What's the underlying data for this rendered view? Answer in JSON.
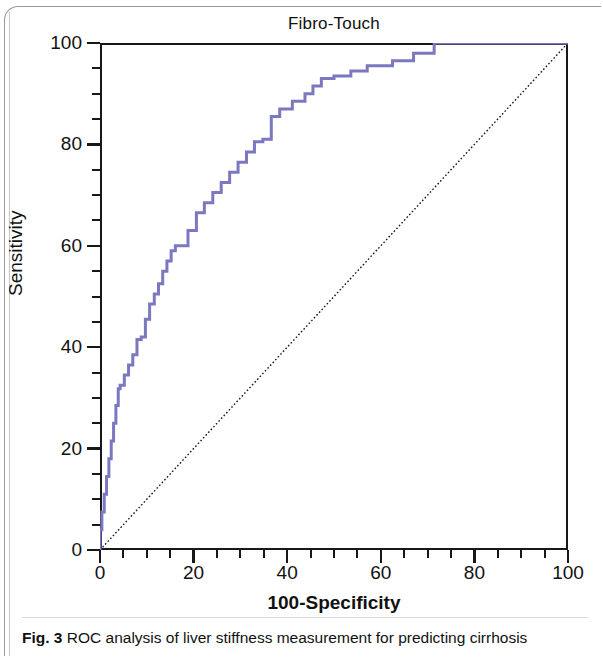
{
  "figure": {
    "caption_lead": "Fig. 3",
    "caption_text": "ROC analysis of liver stiffness measurement for predicting cirrhosis"
  },
  "chart_data": {
    "type": "line",
    "title": "Fibro-Touch",
    "xlabel": "100-Specificity",
    "ylabel": "Sensitivity",
    "xlim": [
      0,
      100
    ],
    "ylim": [
      0,
      100
    ],
    "grid": false,
    "legend": null,
    "xticks": [
      0,
      20,
      40,
      60,
      80,
      100
    ],
    "yticks": [
      0,
      20,
      40,
      60,
      80,
      100
    ],
    "xtick_labels": [
      "0",
      "20",
      "40",
      "60",
      "80",
      "100"
    ],
    "ytick_labels": [
      "0",
      "20",
      "40",
      "60",
      "80",
      "100"
    ],
    "minor_tick_step": 5,
    "curve_color": "#7B78C0",
    "reference_line_color": "#1a1a1a",
    "series": [
      {
        "name": "ROC curve",
        "style": "step",
        "color": "#7B78C0",
        "x": [
          0,
          0,
          0.4,
          0.4,
          0.9,
          0.9,
          1.4,
          1.4,
          1.9,
          1.9,
          2.4,
          2.4,
          2.9,
          2.9,
          3.4,
          3.4,
          3.9,
          3.9,
          4.3,
          4.3,
          5.2,
          5.2,
          6.1,
          6.1,
          7.0,
          7.0,
          7.9,
          7.9,
          8.8,
          8.8,
          9.7,
          9.7,
          10.6,
          10.6,
          11.6,
          11.6,
          12.5,
          12.5,
          13.4,
          13.4,
          14.3,
          14.3,
          15.2,
          15.2,
          16.1,
          16.1,
          17.0,
          17.0,
          18.8,
          18.8,
          20.6,
          20.6,
          22.3,
          22.3,
          24.1,
          24.1,
          25.9,
          25.9,
          27.7,
          27.7,
          29.5,
          29.5,
          31.3,
          31.3,
          33.0,
          33.0,
          34.8,
          34.8,
          36.6,
          36.6,
          38.4,
          38.4,
          41.1,
          41.1,
          43.8,
          43.8,
          45.5,
          45.5,
          47.3,
          47.3,
          50.0,
          50.0,
          53.6,
          53.6,
          57.1,
          57.1,
          62.5,
          62.5,
          67.0,
          67.0,
          71.4,
          71.4,
          100
        ],
        "y": [
          0,
          4.0,
          4.0,
          7.5,
          7.5,
          11.0,
          11.0,
          14.5,
          14.5,
          18.0,
          18.0,
          21.5,
          21.5,
          25.0,
          25.0,
          28.5,
          28.5,
          31.8,
          31.8,
          32.5,
          32.5,
          34.5,
          34.5,
          36.5,
          36.5,
          38.5,
          38.5,
          41.5,
          41.5,
          42.0,
          42.0,
          45.5,
          45.5,
          48.5,
          48.5,
          50.5,
          50.5,
          52.5,
          52.5,
          55.0,
          55.0,
          57.0,
          57.0,
          59.0,
          59.0,
          60.0,
          60.0,
          60.0,
          60.0,
          63.0,
          63.0,
          66.5,
          66.5,
          68.5,
          68.5,
          70.5,
          70.5,
          72.5,
          72.5,
          74.5,
          74.5,
          76.5,
          76.5,
          78.5,
          78.5,
          80.5,
          80.5,
          81.0,
          81.0,
          85.5,
          85.5,
          87.0,
          87.0,
          88.5,
          88.5,
          90.0,
          90.0,
          91.5,
          91.5,
          93.0,
          93.0,
          93.5,
          93.5,
          94.5,
          94.5,
          95.5,
          95.5,
          96.5,
          96.5,
          98.0,
          98.0,
          100.0,
          100.0
        ]
      },
      {
        "name": "Reference line",
        "style": "dotted-diagonal",
        "color": "#1a1a1a",
        "x": [
          0,
          100
        ],
        "y": [
          0,
          100
        ]
      }
    ]
  }
}
